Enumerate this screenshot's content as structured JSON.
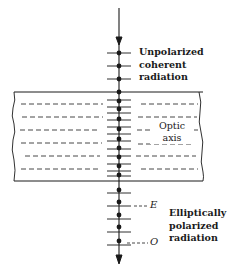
{
  "diagram": {
    "type": "birefringent-crystal-polarization",
    "colors": {
      "ink": "#1a1a1a",
      "background": "#ffffff"
    },
    "labels": {
      "input_line1": "Unpolarized",
      "input_line2": "coherent",
      "input_line3": "radiation",
      "optic_line1": "Optic",
      "optic_line2": "axis",
      "e_ray": "E",
      "o_ray": "O",
      "output_line1": "Elliptically",
      "output_line2": "polarized",
      "output_line3": "radiation"
    },
    "beam": {
      "direction": "downward",
      "x": 119,
      "y_start": 8,
      "y_end": 262
    },
    "crystal": {
      "left": 14,
      "right": 203,
      "top": 92,
      "bottom": 181,
      "dashed_rows": 5
    }
  }
}
